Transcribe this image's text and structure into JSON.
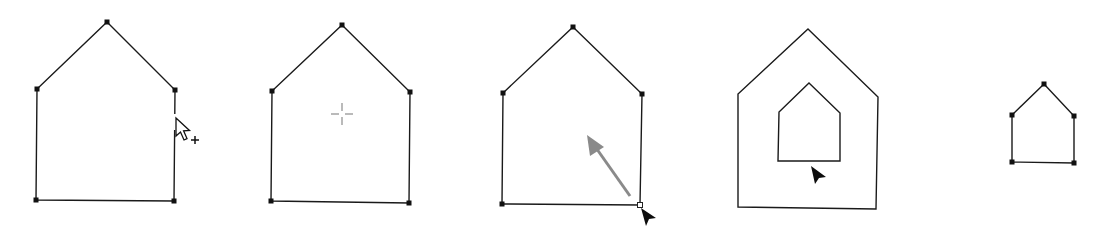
{
  "figure": {
    "panels": [
      {
        "id": "panel-1",
        "caption_hint": "add anchor point cursor hovering on path edge",
        "shape": "house",
        "points": [
          [
            107,
            22
          ],
          [
            175,
            90
          ],
          [
            174,
            201
          ],
          [
            36,
            200
          ],
          [
            37,
            89
          ]
        ],
        "anchors_visible": true,
        "cursor": {
          "icon": "add-anchor-point-cursor-icon",
          "x": 176,
          "y": 118
        }
      },
      {
        "id": "panel-2",
        "caption_hint": "crosshair cursor in the center of the shape",
        "shape": "house",
        "points": [
          [
            342,
            25
          ],
          [
            410,
            92
          ],
          [
            409,
            203
          ],
          [
            271,
            201
          ],
          [
            272,
            91
          ]
        ],
        "anchors_visible": true,
        "cursor": {
          "icon": "crosshair-cursor-icon",
          "x": 342,
          "y": 114
        }
      },
      {
        "id": "panel-3",
        "caption_hint": "dragging the selected corner point inward",
        "shape": "house",
        "points": [
          [
            573,
            27
          ],
          [
            642,
            94
          ],
          [
            640,
            205
          ],
          [
            502,
            204
          ],
          [
            503,
            93
          ]
        ],
        "anchors_visible": true,
        "selected_anchor_index": 2,
        "drag_arrow": {
          "from": [
            630,
            196
          ],
          "to": [
            587,
            135
          ],
          "color": "#8a8a8a"
        },
        "cursor": {
          "icon": "selection-arrow-cursor-icon",
          "x": 641,
          "y": 208
        }
      },
      {
        "id": "panel-4",
        "caption_hint": "outer house with a smaller inner house copy",
        "shapes": [
          {
            "name": "outer",
            "points": [
              [
                808,
                29
              ],
              [
                878,
                97
              ],
              [
                876,
                209
              ],
              [
                738,
                207
              ],
              [
                738,
                94
              ]
            ]
          },
          {
            "name": "inner",
            "points": [
              [
                809,
                83
              ],
              [
                840,
                113
              ],
              [
                840,
                161
              ],
              [
                778,
                161
              ],
              [
                779,
                112
              ]
            ]
          }
        ],
        "anchors_visible": false,
        "cursor": {
          "icon": "selection-arrow-cursor-icon",
          "x": 811,
          "y": 167
        }
      },
      {
        "id": "panel-5",
        "caption_hint": "small house with anchor points selected",
        "shape": "house",
        "points": [
          [
            1044,
            84
          ],
          [
            1074,
            116
          ],
          [
            1074,
            163
          ],
          [
            1012,
            162
          ],
          [
            1012,
            115
          ]
        ],
        "anchors_visible": true
      }
    ],
    "colors": {
      "stroke": "#1a1a1a",
      "anchor": "#111111",
      "drag_arrow": "#8a8a8a",
      "crosshair": "#8c8c8c",
      "background": "#ffffff"
    }
  }
}
